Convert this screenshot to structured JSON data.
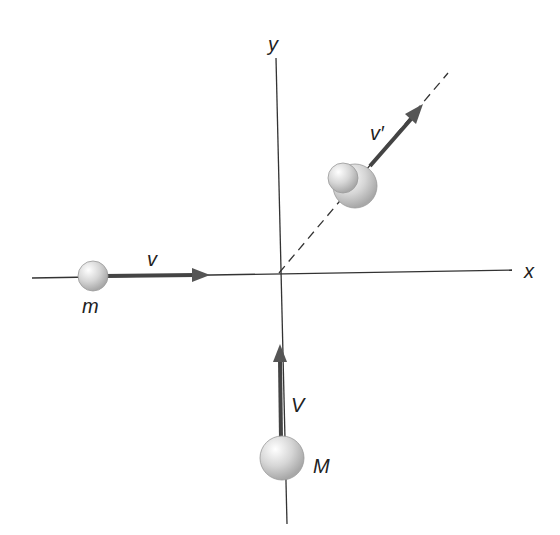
{
  "diagram": {
    "type": "two-body perfectly inelastic collision in 2D",
    "axes": {
      "x_label": "x",
      "y_label": "y"
    },
    "bodies": [
      {
        "id": "small",
        "mass_label": "m",
        "velocity_label": "v",
        "direction": "+x"
      },
      {
        "id": "large",
        "mass_label": "M",
        "velocity_label": "V",
        "direction": "+y"
      }
    ],
    "combined": {
      "velocity_label": "v′",
      "direction": "diagonal up-right (dashed path)"
    },
    "colors": {
      "axis": "#333333",
      "arrow": "#444444",
      "sphere": "#d0d0d0"
    }
  }
}
